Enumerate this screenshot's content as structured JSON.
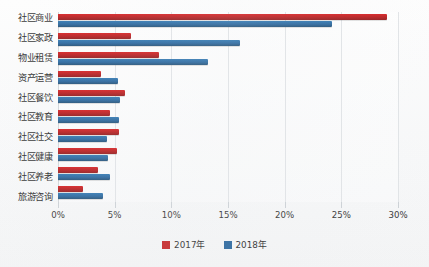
{
  "chart_data": {
    "type": "bar",
    "orientation": "horizontal",
    "title": "",
    "xlabel": "",
    "ylabel": "",
    "xlim": [
      0,
      30
    ],
    "xunit": "%",
    "grid": true,
    "legend_position": "bottom",
    "xticks": [
      "0%",
      "5%",
      "10%",
      "15%",
      "20%",
      "25%",
      "30%"
    ],
    "xtick_values": [
      0,
      5,
      10,
      15,
      20,
      25,
      30
    ],
    "categories": [
      "社区商业",
      "社区家政",
      "物业租赁",
      "资产运营",
      "社区餐饮",
      "社区教育",
      "社区社交",
      "社区健康",
      "社区养老",
      "旅游咨询"
    ],
    "series": [
      {
        "name": "2017年",
        "color": "#c01214",
        "values": [
          29.0,
          6.4,
          8.9,
          3.8,
          5.9,
          4.6,
          5.4,
          5.2,
          3.5,
          2.2
        ]
      },
      {
        "name": "2018年",
        "color": "#1d5d97",
        "values": [
          24.2,
          16.1,
          13.2,
          5.3,
          5.5,
          5.4,
          4.3,
          4.4,
          4.6,
          4.0
        ]
      }
    ]
  },
  "legend": {
    "items": [
      {
        "label": "2017年",
        "swatch": "red-square-icon"
      },
      {
        "label": "2018年",
        "swatch": "blue-square-icon"
      }
    ]
  }
}
